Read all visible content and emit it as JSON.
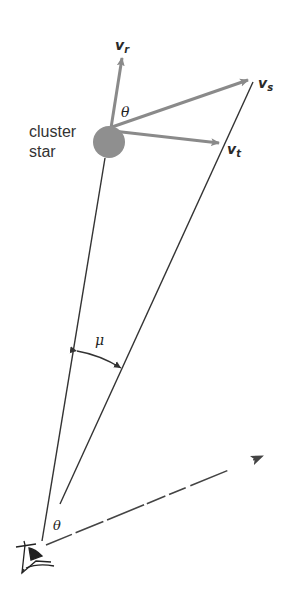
{
  "figure": {
    "star_label_line1": "cluster",
    "star_label_line2": "star",
    "vectors": {
      "radial": {
        "symbol": "v",
        "subscript": "r"
      },
      "space": {
        "symbol": "v",
        "subscript": "s"
      },
      "tangential": {
        "symbol": "v",
        "subscript": "t"
      }
    },
    "angle_at_star": "θ",
    "angle_at_observer": "θ",
    "proper_motion_angle": "μ",
    "observer_icon": "eye-icon",
    "colors": {
      "vector_gray": "#8a8a8a",
      "star_fill": "#8f8f8f",
      "line_dark": "#333333"
    }
  }
}
